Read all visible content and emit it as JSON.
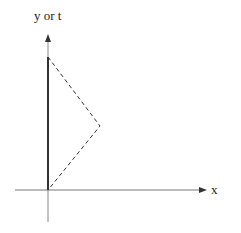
{
  "diagram": {
    "y_axis_label": "y or t",
    "x_axis_label": "x",
    "origin": [
      48,
      190
    ],
    "y_axis": {
      "x": 48,
      "top": 34,
      "bottom": 222
    },
    "x_axis": {
      "y": 190,
      "left": 15,
      "right": 207
    },
    "thick_segment": {
      "x": 48,
      "y1": 57,
      "y2": 190
    },
    "dashed_path": [
      [
        48,
        57
      ],
      [
        100,
        126
      ],
      [
        48,
        190
      ]
    ],
    "colors": {
      "line": "#333333",
      "thin": "#888888"
    }
  }
}
